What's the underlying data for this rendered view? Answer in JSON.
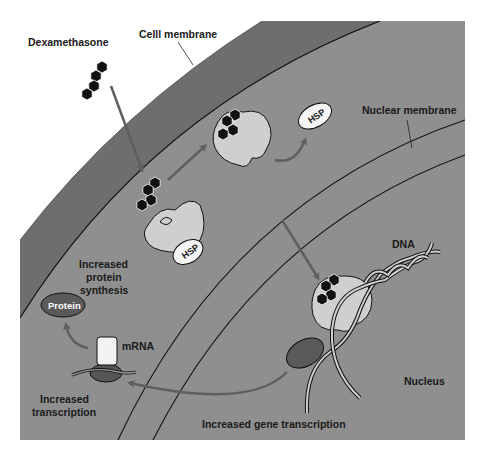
{
  "diagram": {
    "labels": {
      "dexamethasone": "Dexamethasone",
      "cell_membrane": "Celll membrane",
      "nuclear_membrane": "Nuclear membrane",
      "hsp_free": "HSP",
      "hsp_bound": "HSP",
      "dna": "DNA",
      "nucleus": "Nucleus",
      "increased_gene_transcription": "Increased gene transcription",
      "mrna": "mRNA",
      "protein": "Protein",
      "increased_protein_synthesis_line1": "Increased",
      "increased_protein_synthesis_line2": "protein",
      "increased_protein_synthesis_line3": "synthesis",
      "increased_transcription_line1": "Increased",
      "increased_transcription_line2": "transcription"
    },
    "colors": {
      "background": "#ffffff",
      "cytoplasm": "#8f8f8f",
      "membrane_band": "#6e6e6e",
      "nucleus_fill": "#939393",
      "receptor": "#cfcfcf",
      "arrow": "#5f5f5f",
      "steroid": "#111111",
      "protein_oval": "#5a5a5a",
      "ribosome": "#555555",
      "mrna_box": "#f2f2f2"
    }
  }
}
